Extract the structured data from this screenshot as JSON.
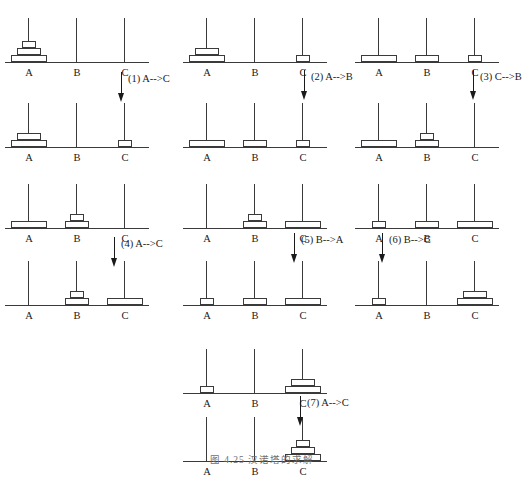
{
  "figure": {
    "caption": "图 4.25   汉诺塔的求解",
    "peg_labels": [
      "A",
      "B",
      "C"
    ],
    "disc_sizes": [
      "s3",
      "s2",
      "s1"
    ],
    "ink_color": "#3a3a3a",
    "text_color": "#1a1a1a"
  },
  "groups": [
    {
      "id": "group-1",
      "before": {
        "id": "state-0",
        "pegs": [
          {
            "label": "A",
            "discs": [
              3,
              2,
              1
            ]
          },
          {
            "label": "B",
            "discs": []
          },
          {
            "label": "C",
            "discs": []
          }
        ]
      },
      "move": {
        "number": "(1)",
        "text": "(1) A-->C",
        "from": "A",
        "to": "C"
      },
      "after": {
        "id": "state-1",
        "pegs": [
          {
            "label": "A",
            "discs": [
              3,
              2
            ]
          },
          {
            "label": "B",
            "discs": []
          },
          {
            "label": "C",
            "discs": [
              1
            ]
          }
        ]
      }
    },
    {
      "id": "group-2",
      "before": {
        "id": "state-1b",
        "pegs": [
          {
            "label": "A",
            "discs": [
              3,
              2
            ]
          },
          {
            "label": "B",
            "discs": []
          },
          {
            "label": "C",
            "discs": [
              1
            ]
          }
        ]
      },
      "move": {
        "number": "(2)",
        "text": "(2) A-->B",
        "from": "A",
        "to": "B"
      },
      "after": {
        "id": "state-2",
        "pegs": [
          {
            "label": "A",
            "discs": [
              3
            ]
          },
          {
            "label": "B",
            "discs": [
              2
            ]
          },
          {
            "label": "C",
            "discs": [
              1
            ]
          }
        ]
      }
    },
    {
      "id": "group-3",
      "before": {
        "id": "state-2b",
        "pegs": [
          {
            "label": "A",
            "discs": [
              3
            ]
          },
          {
            "label": "B",
            "discs": [
              2
            ]
          },
          {
            "label": "C",
            "discs": [
              1
            ]
          }
        ]
      },
      "move": {
        "number": "(3)",
        "text": "(3) C-->B",
        "from": "C",
        "to": "B"
      },
      "after": {
        "id": "state-3",
        "pegs": [
          {
            "label": "A",
            "discs": [
              3
            ]
          },
          {
            "label": "B",
            "discs": [
              2,
              1
            ]
          },
          {
            "label": "C",
            "discs": []
          }
        ]
      }
    },
    {
      "id": "group-4",
      "before": {
        "id": "state-3b",
        "pegs": [
          {
            "label": "A",
            "discs": [
              3
            ]
          },
          {
            "label": "B",
            "discs": [
              2,
              1
            ]
          },
          {
            "label": "C",
            "discs": []
          }
        ]
      },
      "move": {
        "number": "(4)",
        "text": "(4) A-->C",
        "from": "A",
        "to": "C"
      },
      "after": {
        "id": "state-4",
        "pegs": [
          {
            "label": "A",
            "discs": []
          },
          {
            "label": "B",
            "discs": [
              2,
              1
            ]
          },
          {
            "label": "C",
            "discs": [
              3
            ]
          }
        ]
      }
    },
    {
      "id": "group-5",
      "before": {
        "id": "state-4b",
        "pegs": [
          {
            "label": "A",
            "discs": []
          },
          {
            "label": "B",
            "discs": [
              2,
              1
            ]
          },
          {
            "label": "C",
            "discs": [
              3
            ]
          }
        ]
      },
      "move": {
        "number": "(5)",
        "text": "(5) B-->A",
        "from": "B",
        "to": "A"
      },
      "after": {
        "id": "state-5",
        "pegs": [
          {
            "label": "A",
            "discs": [
              1
            ]
          },
          {
            "label": "B",
            "discs": [
              2
            ]
          },
          {
            "label": "C",
            "discs": [
              3
            ]
          }
        ]
      }
    },
    {
      "id": "group-6",
      "before": {
        "id": "state-5b",
        "pegs": [
          {
            "label": "A",
            "discs": [
              1
            ]
          },
          {
            "label": "B",
            "discs": [
              2
            ]
          },
          {
            "label": "C",
            "discs": [
              3
            ]
          }
        ]
      },
      "move": {
        "number": "(6)",
        "text": "(6) B-->C",
        "from": "B",
        "to": "C"
      },
      "after": {
        "id": "state-6",
        "pegs": [
          {
            "label": "A",
            "discs": [
              1
            ]
          },
          {
            "label": "B",
            "discs": []
          },
          {
            "label": "C",
            "discs": [
              3,
              2
            ]
          }
        ]
      }
    },
    {
      "id": "group-7",
      "before": {
        "id": "state-6b",
        "pegs": [
          {
            "label": "A",
            "discs": [
              1
            ]
          },
          {
            "label": "B",
            "discs": []
          },
          {
            "label": "C",
            "discs": [
              3,
              2
            ]
          }
        ]
      },
      "move": {
        "number": "(7)",
        "text": "(7) A-->C",
        "from": "A",
        "to": "C"
      },
      "after": {
        "id": "state-7",
        "pegs": [
          {
            "label": "A",
            "discs": []
          },
          {
            "label": "B",
            "discs": []
          },
          {
            "label": "C",
            "discs": [
              3,
              2,
              1
            ]
          }
        ]
      }
    }
  ],
  "layout": {
    "boards": [
      {
        "group": 0,
        "which": "before",
        "x": 8,
        "y": 14
      },
      {
        "group": 0,
        "which": "after",
        "x": 8,
        "y": 99
      },
      {
        "group": 1,
        "which": "before",
        "x": 186,
        "y": 14
      },
      {
        "group": 1,
        "which": "after",
        "x": 186,
        "y": 99
      },
      {
        "group": 2,
        "which": "before",
        "x": 358,
        "y": 14
      },
      {
        "group": 2,
        "which": "after",
        "x": 358,
        "y": 99
      },
      {
        "group": 3,
        "which": "before",
        "x": 8,
        "y": 180
      },
      {
        "group": 3,
        "which": "after",
        "x": 8,
        "y": 257
      },
      {
        "group": 4,
        "which": "before",
        "x": 186,
        "y": 180
      },
      {
        "group": 4,
        "which": "after",
        "x": 186,
        "y": 257
      },
      {
        "group": 5,
        "which": "before",
        "x": 358,
        "y": 180
      },
      {
        "group": 5,
        "which": "after",
        "x": 358,
        "y": 257
      },
      {
        "group": 6,
        "which": "before",
        "x": 186,
        "y": 345
      },
      {
        "group": 6,
        "which": "after",
        "x": 186,
        "y": 413
      }
    ],
    "moves": [
      {
        "group": 0,
        "x": 117,
        "y": 72
      },
      {
        "group": 1,
        "x": 300,
        "y": 70
      },
      {
        "group": 2,
        "x": 469,
        "y": 70
      },
      {
        "group": 3,
        "x": 110,
        "y": 237
      },
      {
        "group": 4,
        "x": 290,
        "y": 233
      },
      {
        "group": 5,
        "x": 378,
        "y": 233
      },
      {
        "group": 6,
        "x": 296,
        "y": 396
      }
    ]
  }
}
